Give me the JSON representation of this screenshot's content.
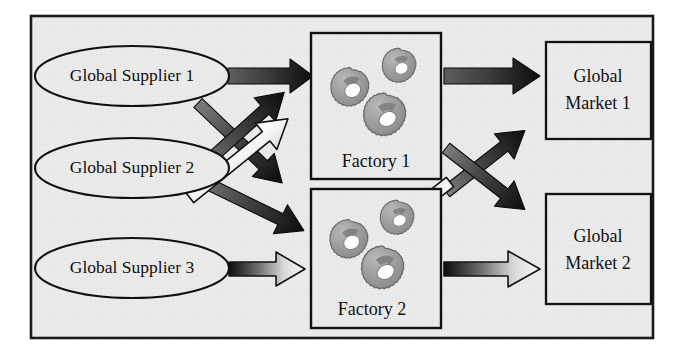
{
  "diagram": {
    "type": "flow-diagram",
    "background_color": "#ebebeb",
    "frame_color": "#151515",
    "node_fill": "#ebebeb",
    "node_stroke": "#101010",
    "gear_fill": "#9e9e9e",
    "gear_shade": "#6f6f6f",
    "gear_hub": "#ffffff",
    "arrow_dark": "#111111",
    "arrow_mid": "#6a6a6a",
    "arrow_light": "#ffffff"
  },
  "suppliers": [
    {
      "id": "supplier-1",
      "label": "Global Supplier 1",
      "cx": 132,
      "cy": 76,
      "rx": 97,
      "ry": 30
    },
    {
      "id": "supplier-2",
      "label": "Global Supplier 2",
      "cx": 132,
      "cy": 168,
      "rx": 97,
      "ry": 30
    },
    {
      "id": "supplier-3",
      "label": "Global Supplier 3",
      "cx": 132,
      "cy": 268,
      "rx": 97,
      "ry": 30
    }
  ],
  "factories": [
    {
      "id": "factory-1",
      "label": "Factory 1",
      "x": 311,
      "y": 33,
      "w": 130,
      "h": 146
    },
    {
      "id": "factory-2",
      "label": "Factory 2",
      "x": 311,
      "y": 189,
      "w": 130,
      "h": 139
    }
  ],
  "markets": [
    {
      "id": "market-1",
      "line1": "Global",
      "line2": "Market 1",
      "x": 546,
      "y": 42,
      "w": 105,
      "h": 97
    },
    {
      "id": "market-2",
      "line1": "Global",
      "line2": "Market 2",
      "x": 546,
      "y": 194,
      "w": 105,
      "h": 110
    }
  ],
  "flows": [
    {
      "id": "flow-s1-f1",
      "from": "Global Supplier 1",
      "to": "Factory 1",
      "style": "solid-dark",
      "direction": "right"
    },
    {
      "id": "flow-s1-f2",
      "from": "Global Supplier 1",
      "to": "Factory 2",
      "style": "solid-dark",
      "direction": "down-right"
    },
    {
      "id": "flow-s2-f1",
      "from": "Global Supplier 2",
      "to": "Factory 1",
      "style": "solid-dark",
      "direction": "up-right"
    },
    {
      "id": "flow-s2-f2",
      "from": "Global Supplier 2",
      "to": "Factory 2",
      "style": "solid-dark",
      "direction": "down-right"
    },
    {
      "id": "flow-s3-f1",
      "from": "Global Supplier 3",
      "to": "Factory 1",
      "style": "hollow-white",
      "direction": "up-right"
    },
    {
      "id": "flow-s3-f2",
      "from": "Global Supplier 3",
      "to": "Factory 2",
      "style": "hollow-white",
      "direction": "right"
    },
    {
      "id": "flow-f1-m1",
      "from": "Factory 1",
      "to": "Global Market 1",
      "style": "solid-dark",
      "direction": "right"
    },
    {
      "id": "flow-f1-m2",
      "from": "Factory 1",
      "to": "Global Market 2",
      "style": "solid-dark",
      "direction": "down-right"
    },
    {
      "id": "flow-f2-m1",
      "from": "Factory 2",
      "to": "Global Market 1",
      "style": "solid-dark",
      "direction": "up-right"
    },
    {
      "id": "flow-f2-m2",
      "from": "Factory 2",
      "to": "Global Market 2",
      "style": "hollow-white",
      "direction": "right"
    },
    {
      "id": "flow-m1-f2",
      "from": "Global Market 1",
      "to": "Factory 2",
      "style": "hollow-white",
      "direction": "down-left"
    }
  ],
  "gears_per_factory": 3
}
